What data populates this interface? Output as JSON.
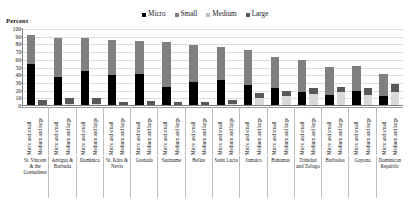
{
  "chart_data": {
    "type": "bar",
    "subtype": "grouped-stacked",
    "title": "",
    "ylabel": "Percent",
    "xlabel": "",
    "ylim": [
      0,
      100
    ],
    "yticks": [
      0,
      10,
      20,
      30,
      40,
      50,
      60,
      70,
      80,
      90,
      100
    ],
    "grid": true,
    "legend_position": "top-right",
    "legend": [
      "Micro",
      "Small",
      "Medium",
      "Large"
    ],
    "series_colors": {
      "Micro": "#000000",
      "Small": "#808080",
      "Medium": "#595959",
      "Large": "#d9d9d9"
    },
    "bar_group_labels": [
      "Micro and small",
      "Medium and large"
    ],
    "categories": [
      "St. Vincent & the Grenadines",
      "Antigua & Barbuda",
      "Dominica",
      "St. Kitts & Nevis",
      "Grenada",
      "Suriname",
      "Belize",
      "Saint Lucia",
      "Jamaica",
      "Bahamas",
      "Trinidad and Tobago",
      "Barbados",
      "Guyana",
      "Dominican Republic"
    ],
    "series": [
      {
        "name": "Micro",
        "bar": "Micro and small",
        "values": [
          54,
          38,
          45,
          40,
          42,
          25,
          31,
          34,
          27,
          24,
          18,
          14,
          20,
          13
        ]
      },
      {
        "name": "Small",
        "bar": "Micro and small",
        "values": [
          38,
          50,
          43,
          46,
          42,
          58,
          48,
          43,
          46,
          40,
          42,
          37,
          32,
          29
        ]
      },
      {
        "name": "Medium",
        "bar": "Medium and large",
        "values": [
          7,
          8,
          9,
          4,
          5,
          4,
          4,
          6,
          6,
          6,
          8,
          7,
          9,
          11
        ]
      },
      {
        "name": "Large",
        "bar": "Medium and large",
        "values": [
          1,
          2,
          2,
          1,
          1,
          1,
          1,
          2,
          11,
          13,
          15,
          18,
          14,
          18
        ]
      }
    ]
  },
  "legend": {
    "items": [
      {
        "label": "Micro",
        "color": "#000000"
      },
      {
        "label": "Small",
        "color": "#808080"
      },
      {
        "label": "Medium",
        "color": "#bfbfbf"
      },
      {
        "label": "Large",
        "color": "#595959"
      }
    ]
  },
  "axis": {
    "y_title": "Percent"
  }
}
